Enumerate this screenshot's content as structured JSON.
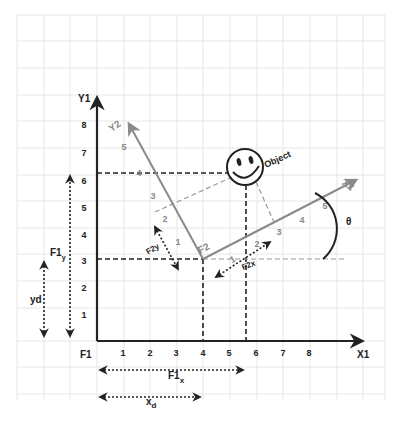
{
  "diagram": {
    "frame1": {
      "origin_label": "F1",
      "x_axis_label": "X1",
      "y_axis_label": "Y1",
      "x_ticks": [
        "1",
        "2",
        "3",
        "4",
        "5",
        "6",
        "7",
        "8"
      ],
      "y_ticks": [
        "1",
        "2",
        "3",
        "4",
        "5",
        "6",
        "7",
        "8"
      ]
    },
    "frame2": {
      "origin_label": "F2",
      "x_axis_label": "X2",
      "y_axis_label": "Y2",
      "x_ticks": [
        "1",
        "2",
        "3",
        "4",
        "5"
      ],
      "y_ticks": [
        "1",
        "2",
        "3",
        "4",
        "5"
      ],
      "origin_in_f1": {
        "x": 4,
        "y": 3
      }
    },
    "object": {
      "label": "Object",
      "position_f1": {
        "x": 5.6,
        "y": 6.2
      }
    },
    "angle_label": "θ",
    "dimensions": {
      "f1x_label": "F1",
      "f1x_sub": "x",
      "xd_label": "x",
      "xd_sub": "d",
      "f1y_label": "F1",
      "f1y_sub": "y",
      "yd_label": "yd",
      "f2x_label": "F2x",
      "f2y_label": "F2y"
    },
    "colors": {
      "grid": "#e6e6e6",
      "axis": "#222222",
      "frame2_axis": "#8a8a8a",
      "dashed": "#222222",
      "frame2_dashed": "#9a9a9a"
    }
  }
}
